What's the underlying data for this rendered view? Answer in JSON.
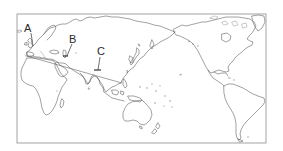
{
  "map": {
    "projection": "Pacific-centered world outline map",
    "frame": {
      "x": 17,
      "y": 14,
      "width": 249,
      "height": 129,
      "stroke": "#9a9a9a"
    },
    "coastline_color": "#555555",
    "background": "#ffffff",
    "labels": [
      {
        "id": "A",
        "text": "A",
        "x": 30,
        "y": 32,
        "points_to": "Western Europe (British Isles)"
      },
      {
        "id": "B",
        "text": "B",
        "x": 70,
        "y": 41,
        "points_to": "Black Sea / Caspian region"
      },
      {
        "id": "C",
        "text": "C",
        "x": 97,
        "y": 51,
        "points_to": "Himalaya / Tibetan Plateau"
      }
    ],
    "regions_shown": [
      "Europe",
      "Africa",
      "Asia",
      "Australia",
      "North America",
      "South America",
      "Pacific Ocean islands"
    ]
  }
}
